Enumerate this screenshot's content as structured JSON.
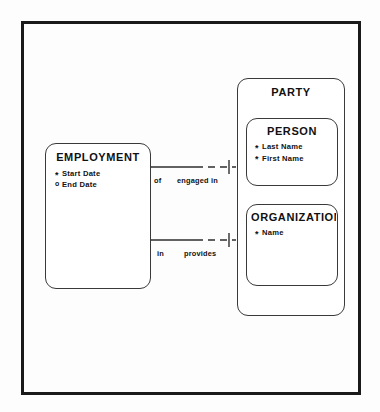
{
  "diagram": {
    "notation": "barker-erd",
    "line_color": "#3a3a3a",
    "text_color": "#111111",
    "frame_color": "#1a1a1a",
    "background": "#fdfdfd"
  },
  "entities": {
    "employment": {
      "title": "EMPLOYMENT",
      "attributes": [
        {
          "marker": "*",
          "name": "Start Date",
          "optionality": "mandatory"
        },
        {
          "marker": "o",
          "name": "End Date",
          "optionality": "optional"
        }
      ]
    },
    "party": {
      "title": "PARTY",
      "attributes": []
    },
    "person": {
      "title": "PERSON",
      "attributes": [
        {
          "marker": "*",
          "name": "Last Name",
          "optionality": "mandatory"
        },
        {
          "marker": "*",
          "name": "First Name",
          "optionality": "mandatory"
        }
      ]
    },
    "organization": {
      "title": "ORGANIZATION",
      "attributes": [
        {
          "marker": "*",
          "name": "Name",
          "optionality": "mandatory"
        }
      ]
    }
  },
  "relationships": [
    {
      "id": "engaged-in",
      "near_label": "of",
      "far_label": "engaged in",
      "from": "EMPLOYMENT",
      "to": "PARTY",
      "from_end": "many",
      "to_end": "one"
    },
    {
      "id": "provides",
      "near_label": "in",
      "far_label": "provides",
      "from": "EMPLOYMENT",
      "to": "PARTY",
      "from_end": "many",
      "to_end": "one"
    }
  ]
}
